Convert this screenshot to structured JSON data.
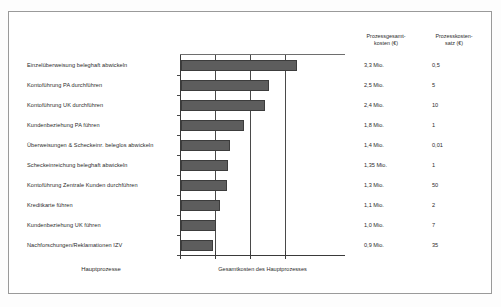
{
  "chart_data": {
    "type": "bar",
    "orientation": "horizontal",
    "title": "",
    "xlabel": "Gesamtkosten des Hauptprozesses",
    "ylabel": "Hauptprozesse",
    "grid": true,
    "legend": "none",
    "xlim": [
      0,
      3.8
    ],
    "xticks": [
      0,
      1,
      2,
      3
    ],
    "unit": "Mio. €",
    "categories": [
      "Einzelüberweisung beleghaft abwickeln",
      "Kontoführung PA durchführen",
      "Kontoführung UK durchführen",
      "Kundenbeziehung PA führen",
      "Überweisungen & Scheckeinr. beleglos abwickeln",
      "Scheckeinreichung beleghaft abwickeln",
      "Kontoführung Zentrale Kunden durchführen",
      "Kreditkarte führen",
      "Kundenbeziehung UK führen",
      "Nachforschungen/Reklamationen IZV"
    ],
    "values": [
      3.3,
      2.5,
      2.4,
      1.8,
      1.4,
      1.35,
      1.3,
      1.1,
      1.0,
      0.9
    ],
    "series": [
      {
        "name": "Prozessgesamtkosten",
        "values": [
          3.3,
          2.5,
          2.4,
          1.8,
          1.4,
          1.35,
          1.3,
          1.1,
          1.0,
          0.9
        ]
      },
      {
        "name": "Prozesskostensatz",
        "values": [
          0.5,
          5,
          10,
          1,
          0.01,
          1,
          50,
          2,
          7,
          35
        ]
      }
    ],
    "bar_color": "#5d5d5d"
  },
  "axes": {
    "y_caption": "Hauptprozesse",
    "x_caption": "Gesamtkosten des Hauptprozesses"
  },
  "process_rows": [
    {
      "label": "Einzelüberweisung beleghaft abwickeln",
      "total": "3,3 Mio.",
      "rate": "0,5"
    },
    {
      "label": "Kontoführung PA durchführen",
      "total": "2,5 Mio.",
      "rate": "5"
    },
    {
      "label": "Kontoführung UK durchführen",
      "total": "2,4 Mio.",
      "rate": "10"
    },
    {
      "label": "Kundenbeziehung PA führen",
      "total": "1,8 Mio.",
      "rate": "1"
    },
    {
      "label": "Überweisungen & Scheckeinr. beleglos abwickeln",
      "total": "1,4 Mio.",
      "rate": "0,01"
    },
    {
      "label": "Scheckeinreichung beleghaft abwickeln",
      "total": "1,35 Mio.",
      "rate": "1"
    },
    {
      "label": "Kontoführung Zentrale Kunden durchführen",
      "total": "1,3 Mio.",
      "rate": "50"
    },
    {
      "label": "Kreditkarte führen",
      "total": "1,1 Mio.",
      "rate": "2"
    },
    {
      "label": "Kundenbeziehung UK führen",
      "total": "1,0 Mio.",
      "rate": "7"
    },
    {
      "label": "Nachforschungen/Reklamationen IZV",
      "total": "0,9 Mio.",
      "rate": "35"
    }
  ],
  "table": {
    "headers": {
      "total_line1": "Prozessgesamt-",
      "total_line2": "kosten (€)",
      "rate_line1": "Prozesskosten-",
      "rate_line2": "satz (€)"
    }
  }
}
